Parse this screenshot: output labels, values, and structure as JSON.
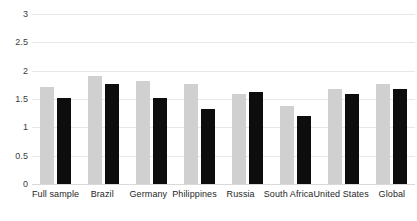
{
  "chart_data": {
    "type": "bar",
    "title": "",
    "subtitle": "",
    "xlabel": "",
    "ylabel": "",
    "ylim": [
      0,
      3
    ],
    "ytick_labels": [
      "3",
      "2.5",
      "2",
      "1.5",
      "1",
      "0.5",
      "0"
    ],
    "ytick_values": [
      3,
      2.5,
      2,
      1.5,
      1,
      0.5,
      0
    ],
    "grid": true,
    "legend": "none",
    "categories": [
      "Full sample",
      "Brazil",
      "Germany",
      "Philippines",
      "Russia",
      "South Africa",
      "United States",
      "Global"
    ],
    "series": [
      {
        "name": "series-1",
        "color": "#d0d0d0",
        "values": [
          1.72,
          1.9,
          1.81,
          1.77,
          1.58,
          1.38,
          1.68,
          1.76
        ]
      },
      {
        "name": "series-2",
        "color": "#0d0d0d",
        "values": [
          1.52,
          1.77,
          1.51,
          1.32,
          1.62,
          1.2,
          1.58,
          1.68
        ]
      }
    ]
  },
  "colors": {
    "series_light": "#d0d0d0",
    "series_dark": "#0d0d0d",
    "gridline": "#e8e8e8",
    "axis_text": "#3c3c3c",
    "background": "#ffffff"
  }
}
